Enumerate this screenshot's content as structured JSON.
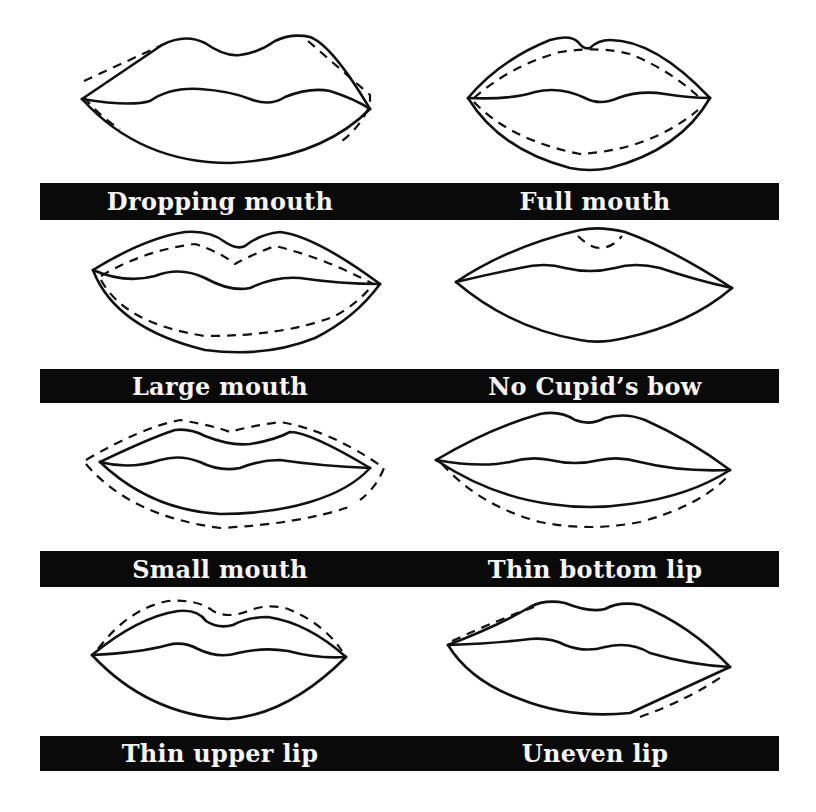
{
  "diagram": {
    "legend": {
      "solid_line": "natural lip outline",
      "dashed_line": "suggested corrective lip line"
    },
    "rows": [
      {
        "left": {
          "label": "Dropping mouth"
        },
        "right": {
          "label": "Full mouth"
        }
      },
      {
        "left": {
          "label": "Large mouth"
        },
        "right": {
          "label": "No Cupid’s bow"
        }
      },
      {
        "left": {
          "label": "Small mouth"
        },
        "right": {
          "label": "Thin bottom lip"
        }
      },
      {
        "left": {
          "label": "Thin upper lip"
        },
        "right": {
          "label": "Uneven lip"
        }
      }
    ]
  },
  "colors": {
    "background": "#ffffff",
    "label_bar": "#0a0a0a",
    "label_text": "#f4f4f4",
    "line": "#111111"
  }
}
